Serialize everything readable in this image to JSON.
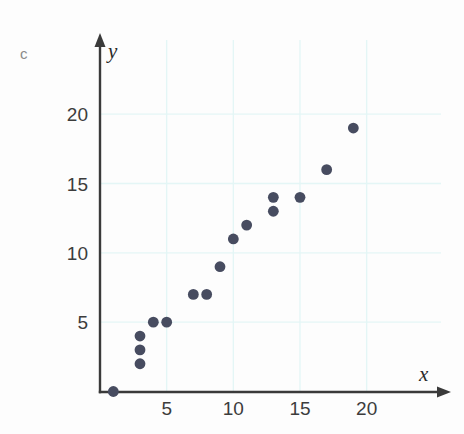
{
  "figure": {
    "part_label": "c",
    "background_color": "#fdfdfd",
    "grid_color": "#e4f6f6",
    "axis_color": "#3a3a3a",
    "point_color": "#474c60"
  },
  "chart_data": {
    "type": "scatter",
    "title": "",
    "xlabel": "x",
    "ylabel": "y",
    "grid": true,
    "legend": false,
    "xlim": [
      0,
      24
    ],
    "ylim": [
      0,
      23
    ],
    "xticks": [
      5,
      10,
      15,
      20
    ],
    "yticks": [
      5,
      10,
      15,
      20
    ],
    "xtick_labels": [
      "5",
      "10",
      "15",
      "20"
    ],
    "ytick_labels": [
      "5",
      "10",
      "15",
      "20"
    ],
    "n_points": 16,
    "x": [
      1,
      3,
      3,
      3,
      4,
      5,
      7,
      8,
      9,
      10,
      11,
      13,
      13,
      15,
      17,
      19
    ],
    "y": [
      0,
      2,
      3,
      4,
      5,
      5,
      7,
      7,
      9,
      11,
      12,
      13,
      14,
      14,
      16,
      19
    ],
    "points": [
      {
        "x": 1,
        "y": 0
      },
      {
        "x": 3,
        "y": 2
      },
      {
        "x": 3,
        "y": 3
      },
      {
        "x": 3,
        "y": 4
      },
      {
        "x": 4,
        "y": 5
      },
      {
        "x": 5,
        "y": 5
      },
      {
        "x": 7,
        "y": 7
      },
      {
        "x": 8,
        "y": 7
      },
      {
        "x": 9,
        "y": 9
      },
      {
        "x": 10,
        "y": 11
      },
      {
        "x": 11,
        "y": 12
      },
      {
        "x": 13,
        "y": 13
      },
      {
        "x": 13,
        "y": 14
      },
      {
        "x": 15,
        "y": 14
      },
      {
        "x": 17,
        "y": 16
      },
      {
        "x": 19,
        "y": 19
      }
    ],
    "marker": "circle",
    "marker_size": 5.4,
    "relationship": "positive linear correlation"
  }
}
